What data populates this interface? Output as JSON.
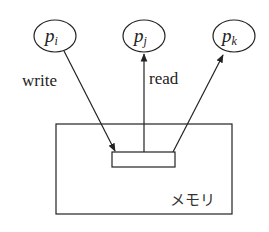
{
  "diagram": {
    "processes": [
      {
        "id": "pi",
        "base": "p",
        "sub": "i",
        "cx": 55,
        "cy": 36
      },
      {
        "id": "pj",
        "base": "p",
        "sub": "j",
        "cx": 144,
        "cy": 36
      },
      {
        "id": "pk",
        "base": "p",
        "sub": "k",
        "cx": 234,
        "cy": 36
      }
    ],
    "edges": [
      {
        "from": "pi",
        "to": "memory-cell",
        "label": "write"
      },
      {
        "from": "memory-cell",
        "to": "pj",
        "label": "read"
      },
      {
        "from": "memory-cell",
        "to": "pk",
        "label": ""
      }
    ],
    "labels": {
      "write": "write",
      "read": "read",
      "memory": "メモリ"
    },
    "colors": {
      "stroke": "#222222",
      "background": "#ffffff"
    }
  }
}
